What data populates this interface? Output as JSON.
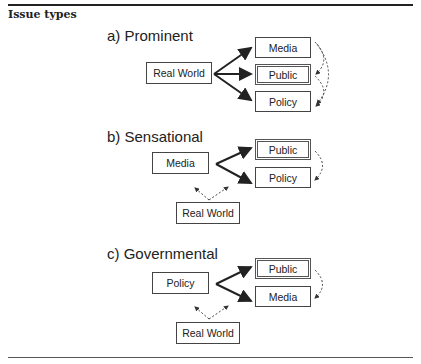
{
  "heading": "Issue types",
  "panels": [
    {
      "title": "a)  Prominent",
      "source": "Real World",
      "targets": [
        "Media",
        "Public",
        "Policy"
      ],
      "highlighted_target": "Public"
    },
    {
      "title": "b)  Sensational",
      "source": "Media",
      "targets": [
        "Public",
        "Policy"
      ],
      "highlighted_target": "Public",
      "secondary": "Real World"
    },
    {
      "title": "c)  Governmental",
      "source": "Policy",
      "targets": [
        "Public",
        "Media"
      ],
      "highlighted_target": "Public",
      "secondary": "Real World"
    }
  ]
}
